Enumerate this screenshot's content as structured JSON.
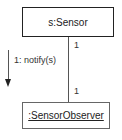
{
  "diagram": {
    "type": "UML communication diagram",
    "objects": [
      {
        "id": "sensor",
        "label": "s:Sensor"
      },
      {
        "id": "observer",
        "label": ":SensorObserver",
        "underlined": true
      }
    ],
    "link": {
      "from": "sensor",
      "to": "observer",
      "multiplicity_top": "1",
      "multiplicity_bottom": "1"
    },
    "message": {
      "label": "1: notify(s)",
      "direction": "down"
    }
  }
}
